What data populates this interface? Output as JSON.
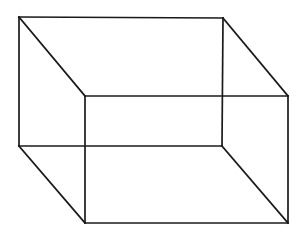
{
  "diagram": {
    "type": "wireframe-box",
    "stroke_color": "#1a1a1a",
    "background": "#ffffff",
    "vertices": {
      "back_top_left": [
        19,
        17
      ],
      "back_top_right": [
        223,
        18
      ],
      "back_bottom_left": [
        19,
        146
      ],
      "back_bottom_right": [
        222,
        146
      ],
      "front_top_left": [
        85,
        96
      ],
      "front_top_right": [
        288,
        96
      ],
      "front_bottom_left": [
        85,
        223
      ],
      "front_bottom_right": [
        288,
        223
      ]
    },
    "edges": [
      [
        "back_top_left",
        "back_top_right"
      ],
      [
        "back_top_right",
        "back_bottom_right"
      ],
      [
        "back_bottom_right",
        "back_bottom_left"
      ],
      [
        "back_bottom_left",
        "back_top_left"
      ],
      [
        "front_top_left",
        "front_top_right"
      ],
      [
        "front_top_right",
        "front_bottom_right"
      ],
      [
        "front_bottom_right",
        "front_bottom_left"
      ],
      [
        "front_bottom_left",
        "front_top_left"
      ],
      [
        "back_top_left",
        "front_top_left"
      ],
      [
        "back_top_right",
        "front_top_right"
      ],
      [
        "back_bottom_left",
        "front_bottom_left"
      ],
      [
        "back_bottom_right",
        "front_bottom_right"
      ]
    ]
  }
}
